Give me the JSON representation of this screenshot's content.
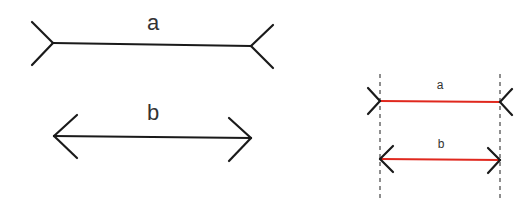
{
  "left_figure": {
    "line_a": {
      "label": "a",
      "fin_style": "outward",
      "color": "#1a1a1a"
    },
    "line_b": {
      "label": "b",
      "fin_style": "inward-arrowheads",
      "color": "#1a1a1a"
    }
  },
  "right_figure": {
    "line_a": {
      "label": "a",
      "fin_style": "outward",
      "shaft_color": "#e0281e",
      "fin_color": "#1a1a1a"
    },
    "line_b": {
      "label": "b",
      "fin_style": "inward-arrowheads",
      "shaft_color": "#e0281e",
      "fin_color": "#1a1a1a"
    },
    "guides": {
      "style": "dashed",
      "color": "#444444",
      "count": 2
    }
  }
}
